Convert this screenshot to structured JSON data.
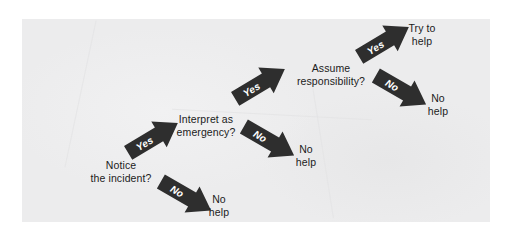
{
  "figure": {
    "panel_color": "#ececed",
    "arrow_color": "#2e2e2e",
    "arrow_label_color": "#ffffff",
    "text_color": "#1b1b1b"
  },
  "nodes": [
    {
      "id": "notice",
      "text": "Notice\nthe incident?"
    },
    {
      "id": "interpret",
      "text": "Interpret as\nemergency?"
    },
    {
      "id": "responsibility",
      "text": "Assume\nresponsibility?"
    }
  ],
  "outcomes": [
    {
      "id": "no-help-1",
      "text": "No\nhelp"
    },
    {
      "id": "no-help-2",
      "text": "No\nhelp"
    },
    {
      "id": "no-help-3",
      "text": "No\nhelp"
    },
    {
      "id": "try-help",
      "text": "Try to\nhelp"
    }
  ],
  "arrows": [
    {
      "id": "notice-no",
      "label": "No",
      "direction": "down-right"
    },
    {
      "id": "notice-yes",
      "label": "Yes",
      "direction": "up-right"
    },
    {
      "id": "interpret-no",
      "label": "No",
      "direction": "down-right"
    },
    {
      "id": "interpret-yes",
      "label": "Yes",
      "direction": "up-right"
    },
    {
      "id": "responsibility-no",
      "label": "No",
      "direction": "down-right"
    },
    {
      "id": "responsibility-yes",
      "label": "Yes",
      "direction": "up-right"
    }
  ]
}
